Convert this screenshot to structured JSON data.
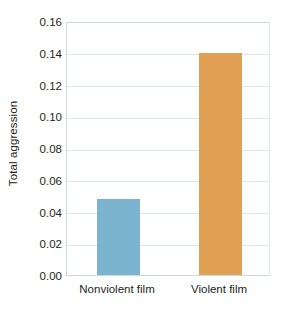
{
  "chart_data": {
    "type": "bar",
    "title": "",
    "subtitle": "",
    "xlabel": "",
    "ylabel": "Total aggression",
    "categories": [
      "Nonviolent film",
      "Violent film"
    ],
    "values": [
      0.048,
      0.14
    ],
    "series": [
      {
        "name": "Total aggression",
        "values": [
          0.048,
          0.14
        ]
      }
    ],
    "ylim": [
      0.0,
      0.16
    ],
    "ytick_step": 0.02,
    "ytick_labels": [
      "0.00",
      "0.02",
      "0.04",
      "0.06",
      "0.08",
      "0.10",
      "0.12",
      "0.14",
      "0.16"
    ],
    "ytick_values": [
      0.0,
      0.02,
      0.04,
      0.06,
      0.08,
      0.1,
      0.12,
      0.14,
      0.16
    ],
    "grid": true,
    "grid_axis": "y",
    "legend": false,
    "legend_position": "none",
    "bar_colors": [
      "#7bb4ce",
      "#e0a155"
    ],
    "grid_color": "#dce6ee",
    "axis_color": "#c9d8e4",
    "text_color": "#231f20",
    "background": "#ffffff",
    "annotations": []
  }
}
